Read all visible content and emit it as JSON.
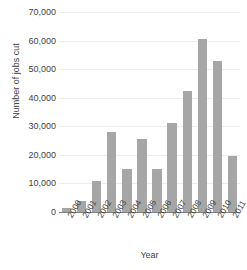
{
  "chart_data": {
    "type": "bar",
    "title": "",
    "xlabel": "Year",
    "ylabel": "Number of jobs cut",
    "categories": [
      "2000",
      "2001",
      "2002",
      "2003",
      "2004",
      "2005",
      "2006",
      "2007",
      "2008",
      "2009",
      "2010",
      "2011"
    ],
    "values": [
      1500,
      4000,
      11000,
      28000,
      15000,
      25500,
      15000,
      31000,
      42500,
      60500,
      53000,
      19500
    ],
    "ylim": [
      0,
      70000
    ],
    "ytick_values": [
      0,
      10000,
      20000,
      30000,
      40000,
      50000,
      60000,
      70000
    ],
    "ytick_labels": [
      "0",
      "10,000",
      "20,000",
      "30,000",
      "40,000",
      "50,000",
      "60,000",
      "70,000"
    ],
    "grid": true,
    "legend": false,
    "bar_color": "#a6a6a6",
    "grid_color": "#ececec",
    "axis_color": "#808080",
    "text_color": "#3f3f3f"
  }
}
